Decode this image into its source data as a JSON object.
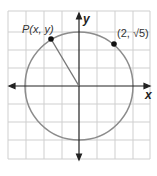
{
  "diagram": {
    "type": "coordinate-plane-circle",
    "axes": {
      "x_label": "x",
      "y_label": "y"
    },
    "grid": {
      "cell_units": 1,
      "x_range": [
        -4,
        4
      ],
      "y_range": [
        -4,
        4
      ],
      "line_color": "#c8c8c8"
    },
    "circle": {
      "center": [
        0,
        0
      ],
      "radius": 3,
      "color": "#8a8a8a"
    },
    "points": [
      {
        "name": "P",
        "label": "P(x, y)",
        "color": "#000000"
      },
      {
        "name": "given-point",
        "label": "(2, √5)",
        "coords": [
          2,
          2.236
        ],
        "color": "#000000"
      }
    ],
    "radius_segment": {
      "from": "origin",
      "to": "P"
    }
  }
}
